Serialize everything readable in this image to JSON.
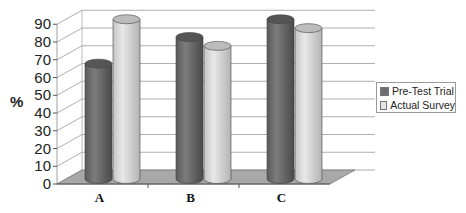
{
  "chart_data": {
    "type": "bar",
    "style": "3d-cylinder",
    "title": "",
    "xlabel": "",
    "ylabel": "%",
    "ylim": [
      0,
      90
    ],
    "yticks": [
      0,
      10,
      20,
      30,
      40,
      50,
      60,
      70,
      80,
      90
    ],
    "grid": true,
    "categories": [
      "A",
      "B",
      "C"
    ],
    "series": [
      {
        "name": "Pre-Test Trial",
        "color": "#6e6e6e",
        "values": [
          65,
          80,
          90
        ]
      },
      {
        "name": "Actual Survey",
        "color": "#d6d6d6",
        "values": [
          90,
          75,
          85
        ]
      }
    ],
    "legend_position": "right"
  }
}
